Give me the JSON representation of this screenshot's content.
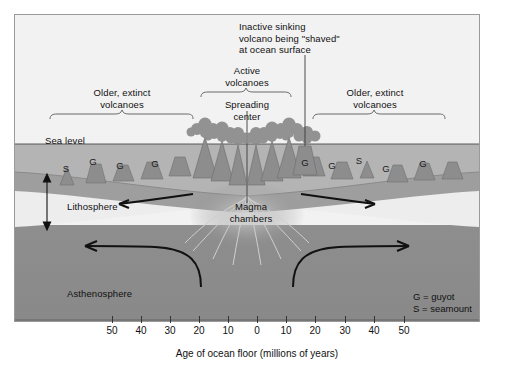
{
  "figure": {
    "title_annotations": {
      "inactive_volcano": "Inactive sinking\nvolcano being \"shaved\"\nat ocean surface",
      "active_volcanoes": "Active\nvolcanoes",
      "spreading_center": "Spreading\ncenter",
      "older_extinct_left": "Older, extinct\nvolcanoes",
      "older_extinct_right": "Older, extinct\nvolcanoes",
      "sea_level": "Sea level",
      "lithosphere": "Lithosphere",
      "magma_chambers": "Magma\nchambers",
      "asthenosphere": "Asthenosphere"
    },
    "legend": {
      "guyot": "G = guyot",
      "seamount": "S = seamount"
    },
    "axis": {
      "title": "Age of ocean floor (millions of years)",
      "ticks": [
        {
          "label": "50",
          "x": 112
        },
        {
          "label": "40",
          "x": 141
        },
        {
          "label": "30",
          "x": 170
        },
        {
          "label": "20",
          "x": 199
        },
        {
          "label": "10",
          "x": 228
        },
        {
          "label": "0",
          "x": 257
        },
        {
          "label": "10",
          "x": 286
        },
        {
          "label": "20",
          "x": 315
        },
        {
          "label": "30",
          "x": 345
        },
        {
          "label": "40",
          "x": 374
        },
        {
          "label": "50",
          "x": 404
        }
      ]
    },
    "seamount_markers": [
      {
        "type": "S",
        "x": 66,
        "y": 163
      },
      {
        "type": "G",
        "x": 93,
        "y": 156
      },
      {
        "type": "G",
        "x": 120,
        "y": 160
      },
      {
        "type": "G",
        "x": 155,
        "y": 158
      },
      {
        "type": "G",
        "x": 305,
        "y": 157
      },
      {
        "type": "G",
        "x": 332,
        "y": 160
      },
      {
        "type": "S",
        "x": 359,
        "y": 155
      },
      {
        "type": "G",
        "x": 386,
        "y": 163
      },
      {
        "type": "G",
        "x": 423,
        "y": 158
      }
    ],
    "colors": {
      "sky": "#f2f2f2",
      "ocean": "#b4b4b4",
      "crust": "#a0a0a0",
      "lithosphere": "#ededed",
      "asthenosphere": "#8c8c8c",
      "frame": "#9a9a9a",
      "ink": "#111111",
      "volcano": "#8f8f8f",
      "plume": "#8a8a8a"
    }
  }
}
